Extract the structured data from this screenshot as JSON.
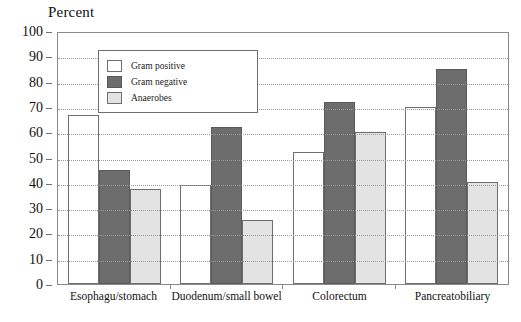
{
  "chart_data": {
    "type": "bar",
    "title": "",
    "ylabel": "Percent",
    "xlabel": "",
    "ylim": [
      0,
      100
    ],
    "ytick_step": 10,
    "yticks": [
      100,
      90,
      80,
      70,
      60,
      50,
      40,
      30,
      20,
      10,
      0
    ],
    "grid": true,
    "legend_position": "inside top-left",
    "categories": [
      "Esophagu/stomach",
      "Duodenum/small bowel",
      "Colorectum",
      "Pancreatobiliary"
    ],
    "series": [
      {
        "name": "Gram positive",
        "color": "#ffffff",
        "values": [
          67,
          39,
          52,
          70
        ]
      },
      {
        "name": "Gram negative",
        "color": "#6d6d6d",
        "values": [
          45,
          62,
          72,
          85
        ]
      },
      {
        "name": "Anaerobes",
        "color": "#e3e3e3",
        "values": [
          37.5,
          25.5,
          60,
          40.5
        ]
      }
    ]
  },
  "legend": {
    "items": [
      {
        "label": "Gram positive"
      },
      {
        "label": "Gram negative"
      },
      {
        "label": "Anaerobes"
      }
    ]
  }
}
